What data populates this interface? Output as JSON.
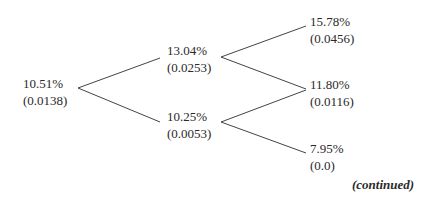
{
  "tree": {
    "nodes": [
      {
        "id": "root",
        "rate": "10.51%",
        "value": "(0.0138)"
      },
      {
        "id": "up",
        "rate": "13.04%",
        "value": "(0.0253)"
      },
      {
        "id": "down",
        "rate": "10.25%",
        "value": "(0.0053)"
      },
      {
        "id": "upup",
        "rate": "15.78%",
        "value": "(0.0456)"
      },
      {
        "id": "updown",
        "rate": "11.80%",
        "value": "(0.0116)"
      },
      {
        "id": "downdown",
        "rate": "7.95%",
        "value": "(0.0)"
      }
    ]
  },
  "footer": {
    "note": "(continued)"
  }
}
